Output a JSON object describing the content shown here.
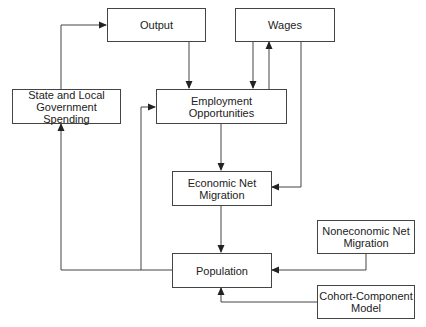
{
  "diagram": {
    "nodes": {
      "output": {
        "label": "Output"
      },
      "wages": {
        "label": "Wages"
      },
      "govt_spending": {
        "label": "State and Local\nGovernment Spending"
      },
      "employment": {
        "label": "Employment Opportunities"
      },
      "econ_migration": {
        "label": "Economic Net\nMigration"
      },
      "population": {
        "label": "Population"
      },
      "noneconomic_migration": {
        "label": "Noneconomic Net\nMigration"
      },
      "cohort_model": {
        "label": "Cohort-Component\nModel"
      }
    },
    "edges": [
      {
        "from": "govt_spending",
        "to": "output"
      },
      {
        "from": "output",
        "to": "employment"
      },
      {
        "from": "wages",
        "to": "employment"
      },
      {
        "from": "employment",
        "to": "wages"
      },
      {
        "from": "wages",
        "to": "econ_migration"
      },
      {
        "from": "employment",
        "to": "econ_migration"
      },
      {
        "from": "econ_migration",
        "to": "population"
      },
      {
        "from": "population",
        "to": "govt_spending"
      },
      {
        "from": "population",
        "to": "employment"
      },
      {
        "from": "noneconomic_migration",
        "to": "population"
      },
      {
        "from": "cohort_model",
        "to": "population"
      }
    ]
  }
}
